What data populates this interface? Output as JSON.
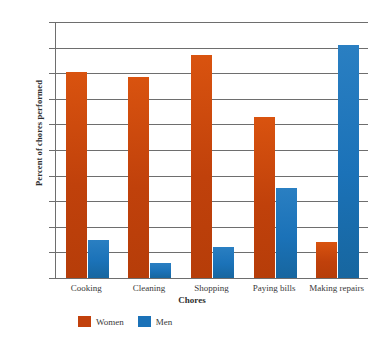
{
  "chart_data": {
    "type": "bar",
    "title": "",
    "subtitle": "",
    "xlabel": "Chores",
    "ylabel": "Percent of chores performed",
    "categories": [
      "Cooking",
      "Cleaning",
      "Shopping",
      "Paying bills",
      "Making repairs"
    ],
    "series": [
      {
        "name": "Women",
        "color": "#c2410c",
        "values": [
          80.5,
          78.5,
          87,
          63,
          14
        ]
      },
      {
        "name": "Men",
        "color": "#1b72b8",
        "values": [
          15,
          6,
          12,
          35,
          91
        ]
      }
    ],
    "ylim": [
      0,
      100
    ],
    "ytick_step": 10,
    "ytick_labels": [
      "0",
      "10",
      "20",
      "30",
      "40",
      "50",
      "60",
      "70",
      "80",
      "90",
      "100"
    ],
    "grid": "horizontal",
    "legend_position": "bottom-left",
    "annotations": []
  },
  "axis": {
    "y_title": "Percent of chores performed",
    "x_title": "Chores"
  },
  "legend": {
    "items": [
      {
        "label": "Women",
        "color": "#c2410c"
      },
      {
        "label": "Men",
        "color": "#1b72b8"
      }
    ]
  },
  "colors": {
    "women": "#c2410c",
    "men": "#1b72b8",
    "gridline": "#6e6e6e",
    "text": "#3a3a3a",
    "background": "#ffffff"
  }
}
